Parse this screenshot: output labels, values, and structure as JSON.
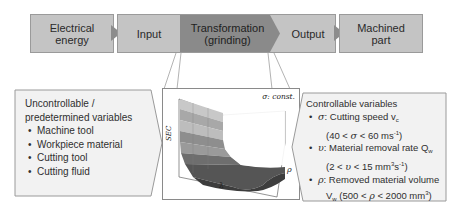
{
  "process_flow": {
    "steps": [
      {
        "label_line1": "Electrical",
        "label_line2": "energy"
      },
      {
        "label": "Input"
      },
      {
        "label_line1": "Transformation",
        "label_line2": "(grinding)"
      },
      {
        "label": "Output"
      },
      {
        "label_line1": "Machined",
        "label_line2": "part"
      }
    ]
  },
  "uncontrollable": {
    "title_line1": "Uncontrollable /",
    "title_line2": "predetermined variables",
    "items": [
      "Machine tool",
      "Workpiece material",
      "Cutting tool",
      "Cutting fluid"
    ]
  },
  "plot": {
    "annotation": "σ: const.",
    "axis_z": "SEC",
    "axis_x": "λ",
    "axis_y": "ρ"
  },
  "controllable": {
    "title": "Controllable variables",
    "items": [
      {
        "symbol": "σ",
        "label": ": Cutting speed v",
        "sub": "c",
        "range_pre": "(40 < ",
        "range_sym": "σ",
        "range_post": " < 60 ms",
        "range_sup": "-1",
        "range_end": ")"
      },
      {
        "symbol": "υ",
        "label": ": Material removal rate Q",
        "sub": "w",
        "range_pre": "(2 < ",
        "range_sym": "υ",
        "range_post": " < 15 mm",
        "range_sup": "3",
        "range_mid": "s",
        "range_sup2": "-1",
        "range_end": ")"
      },
      {
        "symbol": "ρ",
        "label": ": Removed material volume",
        "line2_pre": "V",
        "line2_sub": "w",
        "range_pre": " (500 < ",
        "range_sym": "ρ",
        "range_post": " < 2000 mm",
        "range_sup": "3",
        "range_end": ")"
      }
    ]
  },
  "colors": {
    "box_light": "#c4c4c4",
    "box_dark": "#8a8a8a",
    "arrow": "#8c8c8c",
    "panel_bg": "#f2f2f2",
    "border": "#9a9a9a"
  }
}
